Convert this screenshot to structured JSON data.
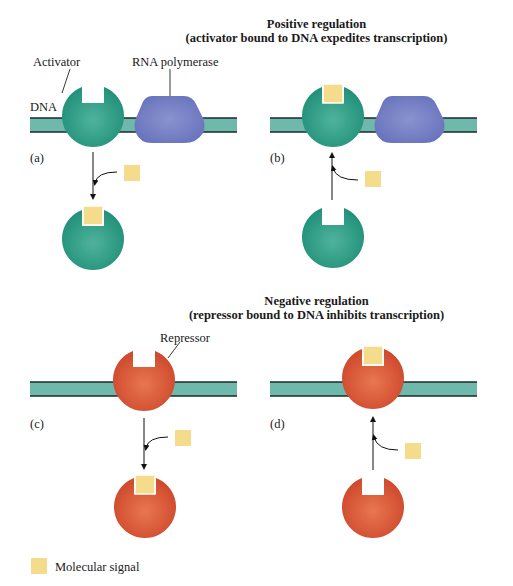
{
  "positive": {
    "title": "Positive regulation",
    "subtitle": "(activator bound to DNA expedites transcription)",
    "labels": {
      "activator": "Activator",
      "rna_polymerase": "RNA polymerase",
      "dna": "DNA"
    },
    "panels": [
      {
        "id": "a",
        "label": "(a)",
        "state": "Activator bound to DNA; signal binds and releases activator",
        "arrow": "down"
      },
      {
        "id": "b",
        "label": "(b)",
        "state": "Signal binds free activator which then binds DNA",
        "arrow": "up"
      }
    ]
  },
  "negative": {
    "title": "Negative regulation",
    "subtitle": "(repressor bound to DNA inhibits transcription)",
    "labels": {
      "repressor": "Repressor"
    },
    "panels": [
      {
        "id": "c",
        "label": "(c)",
        "state": "Repressor bound to DNA; signal binds and releases repressor",
        "arrow": "down"
      },
      {
        "id": "d",
        "label": "(d)",
        "state": "Signal binds free repressor which then binds DNA",
        "arrow": "up"
      }
    ]
  },
  "legend": {
    "items": [
      {
        "label": "Molecular signal",
        "color": "#f4dc8c"
      }
    ]
  },
  "colors": {
    "activator": "#2e9a82",
    "rna_polymerase": "#7480c2",
    "repressor": "#d9583a",
    "dna_fill": "#6fb8ac",
    "dna_edge": "#1c2a28",
    "signal": "#f4dc8c"
  }
}
